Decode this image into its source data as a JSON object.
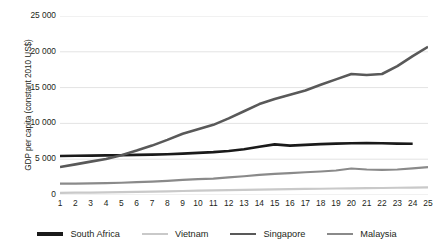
{
  "chart_data": {
    "type": "line",
    "title": "",
    "xlabel": "",
    "ylabel": "GDP per capita (constant 2010 US$)",
    "xlim": [
      1,
      25
    ],
    "ylim": [
      0,
      25000
    ],
    "yticks": [
      0,
      5000,
      10000,
      15000,
      20000,
      25000
    ],
    "ytick_labels": [
      "0",
      "5 000",
      "10 000",
      "15 000",
      "20 000",
      "25 000"
    ],
    "x": [
      1,
      2,
      3,
      4,
      5,
      6,
      7,
      8,
      9,
      10,
      11,
      12,
      13,
      14,
      15,
      16,
      17,
      18,
      19,
      20,
      21,
      22,
      23,
      24,
      25
    ],
    "xtick_labels": [
      "1",
      "2",
      "3",
      "4",
      "5",
      "6",
      "7",
      "8",
      "9",
      "10",
      "11",
      "12",
      "13",
      "14",
      "15",
      "16",
      "17",
      "18",
      "19",
      "20",
      "21",
      "22",
      "23",
      "24",
      "25"
    ],
    "grid": true,
    "grid_axis": "y",
    "legend_position": "bottom",
    "series": [
      {
        "name": "South Africa",
        "color": "#1a1a1a",
        "width": 2.6,
        "x": [
          1,
          2,
          3,
          4,
          5,
          6,
          7,
          8,
          9,
          10,
          11,
          12,
          13,
          14,
          15,
          16,
          17,
          18,
          19,
          20,
          21,
          22,
          23,
          24
        ],
        "values": [
          5450,
          5480,
          5500,
          5530,
          5560,
          5600,
          5640,
          5700,
          5780,
          5880,
          5990,
          6150,
          6400,
          6750,
          7070,
          6900,
          7000,
          7100,
          7180,
          7230,
          7250,
          7220,
          7180,
          7150
        ]
      },
      {
        "name": "Vietnam",
        "color": "#c9c9c9",
        "width": 2.2,
        "x": [
          1,
          2,
          3,
          4,
          5,
          6,
          7,
          8,
          9,
          10,
          11,
          12,
          13,
          14,
          15,
          16,
          17,
          18,
          19,
          20,
          21,
          22,
          23,
          24,
          25
        ],
        "values": [
          300,
          320,
          345,
          375,
          410,
          445,
          480,
          520,
          560,
          600,
          640,
          680,
          715,
          750,
          785,
          815,
          845,
          875,
          905,
          930,
          955,
          980,
          1010,
          1040,
          1070
        ]
      },
      {
        "name": "Singapore",
        "color": "#595959",
        "width": 2.6,
        "x": [
          1,
          2,
          3,
          4,
          5,
          6,
          7,
          8,
          9,
          10,
          11,
          12,
          13,
          14,
          15,
          16,
          17,
          18,
          19,
          20,
          21,
          22,
          23,
          24,
          25
        ],
        "values": [
          3900,
          4280,
          4660,
          5040,
          5560,
          6200,
          6900,
          7700,
          8560,
          9180,
          9800,
          10700,
          11700,
          12700,
          13400,
          14000,
          14600,
          15400,
          16150,
          16900,
          16750,
          16900,
          18000,
          19400,
          20700
        ]
      },
      {
        "name": "Malaysia",
        "color": "#8a8a8a",
        "width": 2.2,
        "x": [
          1,
          2,
          3,
          4,
          5,
          6,
          7,
          8,
          9,
          10,
          11,
          12,
          13,
          14,
          15,
          16,
          17,
          18,
          19,
          20,
          21,
          22,
          23,
          24,
          25
        ],
        "values": [
          1580,
          1590,
          1620,
          1660,
          1710,
          1790,
          1880,
          1980,
          2100,
          2230,
          2280,
          2450,
          2620,
          2800,
          2950,
          3050,
          3180,
          3280,
          3420,
          3700,
          3560,
          3520,
          3560,
          3720,
          3900
        ]
      }
    ]
  },
  "legend": {
    "items": [
      {
        "label": "South Africa",
        "color": "#1a1a1a",
        "thickness": "3.2px"
      },
      {
        "label": "Vietnam",
        "color": "#c9c9c9",
        "thickness": "2.4px"
      },
      {
        "label": "Singapore",
        "color": "#595959",
        "thickness": "2.8px"
      },
      {
        "label": "Malaysia",
        "color": "#8a8a8a",
        "thickness": "2.4px"
      }
    ]
  },
  "axes": {
    "y_title": "GDP per capita (constant 2010 US$)",
    "grid_color": "#e3e3e3"
  }
}
